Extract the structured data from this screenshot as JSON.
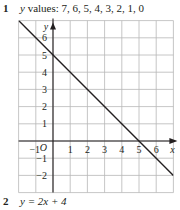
{
  "questions": [
    {
      "number": "1",
      "var": "y",
      "text": " values: 7, 6, 5, 4, 3, 2, 1, 0"
    },
    {
      "number": "2",
      "text": "y = 2x + 4"
    }
  ],
  "chart_data": {
    "type": "line",
    "title": "",
    "xlabel": "x",
    "ylabel": "y",
    "origin_label": "O",
    "x_ticks": [
      "-1",
      "1",
      "2",
      "3",
      "4",
      "5",
      "6"
    ],
    "y_ticks": [
      "6",
      "5",
      "4",
      "3",
      "2",
      "1",
      "-1",
      "-2"
    ],
    "xlim": [
      -2,
      7
    ],
    "ylim": [
      -3,
      7
    ],
    "grid": true,
    "series": [
      {
        "name": "y = 5 - x",
        "x": [
          -2,
          7
        ],
        "y": [
          7,
          -2
        ]
      }
    ],
    "colors": {
      "grid": "#b8b8b8",
      "line": "#231f20",
      "axis": "#231f20"
    }
  }
}
